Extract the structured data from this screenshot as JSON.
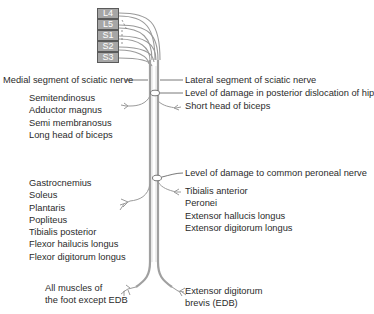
{
  "roots": [
    {
      "label": "L4"
    },
    {
      "label": "L5"
    },
    {
      "label": "S1"
    },
    {
      "label": "S2"
    },
    {
      "label": "S3"
    }
  ],
  "labels": {
    "medial_segment": "Medial segment of sciatic nerve",
    "lateral_segment": "Lateral segment of sciatic nerve",
    "hip_damage": "Level of damage in posterior dislocation of hip",
    "short_head": "Short head of biceps",
    "peroneal_damage": "Level of damage to common peroneal nerve",
    "foot_medial": [
      "All muscles of",
      "the foot except EDB"
    ],
    "foot_lateral": [
      "Extensor digitorum",
      "brevis (EDB)"
    ]
  },
  "thigh_muscles": [
    "Semitendinosus",
    "Adductor magnus",
    "Semi membranosus",
    "Long head of biceps"
  ],
  "tibial_muscles": [
    "Gastrocnemius",
    "Soleus",
    "Plantaris",
    "Popliteus",
    "Tibialis posterior",
    "Flexor hailucis longus",
    "Flexor digitorum longus"
  ],
  "peroneal_muscles": [
    "Tibialis anterior",
    "Peronei",
    "Extensor hallucis longus",
    "Extensor digitorum longus"
  ],
  "colors": {
    "nerve": "#a0a0a0",
    "leader": "#555555",
    "root_fill": "#a6a6a6",
    "text": "#2b2b2b"
  }
}
